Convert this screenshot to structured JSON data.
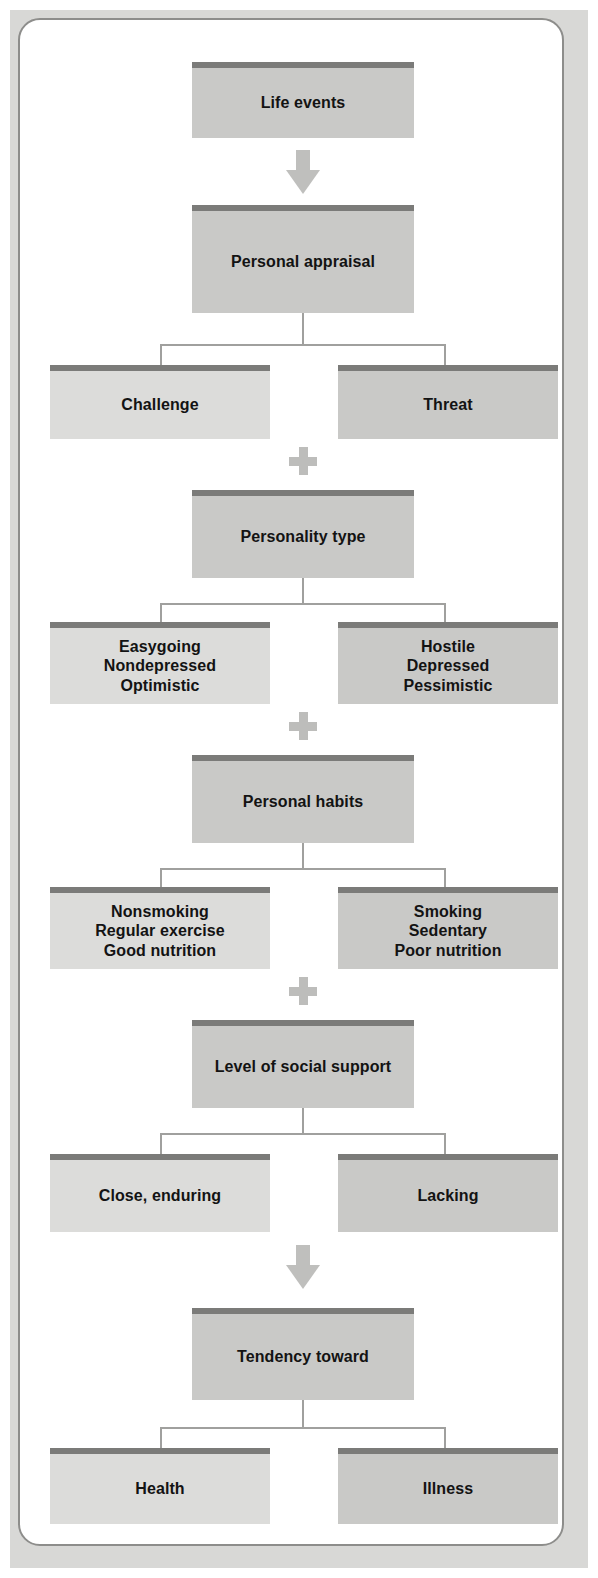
{
  "figure": {
    "type": "flowchart",
    "orientation": "vertical",
    "colors": {
      "box_header": "#7b7b79",
      "box_fill_center": "#c9c9c7",
      "box_fill_left": "#dcdcda",
      "box_fill_right": "#c9c9c7",
      "connector": "#a0a09e",
      "arrow": "#bfbfbd",
      "plus": "#bdbdbb",
      "frame_border": "#8d8d8b",
      "page_background": "#ffffff",
      "plate_background": "#d8d8d6",
      "text": "#131313"
    }
  },
  "nodes": {
    "life_events": "Life events",
    "personal_appraisal": "Personal appraisal",
    "challenge": "Challenge",
    "threat": "Threat",
    "personality_type": "Personality type",
    "easygoing": "Easygoing\nNondepressed\nOptimistic",
    "hostile": "Hostile\nDepressed\nPessimistic",
    "personal_habits": "Personal habits",
    "nonsmoking": "Nonsmoking\nRegular exercise\nGood nutrition",
    "smoking": "Smoking\nSedentary\nPoor nutrition",
    "social_support": "Level of social support",
    "close_enduring": "Close, enduring",
    "lacking": "Lacking",
    "tendency_toward": "Tendency toward",
    "health": "Health",
    "illness": "Illness"
  },
  "connectors": {
    "arrow_top": "down-arrow",
    "arrow_bottom": "down-arrow",
    "plus_1": "+",
    "plus_2": "+",
    "plus_3": "+"
  }
}
